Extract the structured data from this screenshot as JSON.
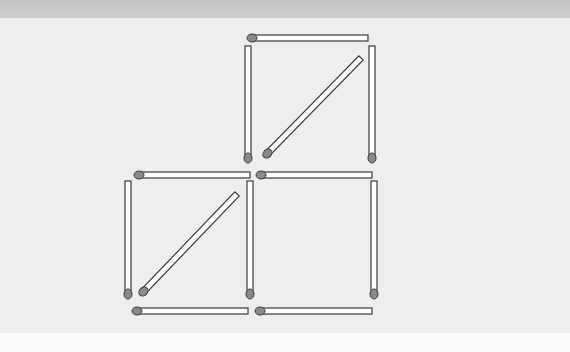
{
  "puzzle": {
    "title": "Matchstick puzzle",
    "match_count": 12,
    "colors": {
      "band": "#c8c8c8",
      "background": "#eeeeee",
      "lower_background": "#fbfbfb",
      "stick_fill": "#ffffff",
      "stick_outline": "#3a3a3a",
      "head_fill": "#8a8a8a"
    },
    "matches": [
      {
        "id": "top-horizontal",
        "x1": 250,
        "y1": 38,
        "x2": 368,
        "y2": 38,
        "head": "start"
      },
      {
        "id": "upper-left-vertical",
        "x1": 248,
        "y1": 160,
        "x2": 248,
        "y2": 46,
        "head": "start"
      },
      {
        "id": "upper-right-vertical",
        "x1": 372,
        "y1": 160,
        "x2": 372,
        "y2": 46,
        "head": "start"
      },
      {
        "id": "upper-diagonal",
        "x1": 266,
        "y1": 155,
        "x2": 361,
        "y2": 58,
        "head": "start"
      },
      {
        "id": "middle-horizontal-left",
        "x1": 137,
        "y1": 175,
        "x2": 250,
        "y2": 175,
        "head": "start"
      },
      {
        "id": "middle-horizontal-right",
        "x1": 259,
        "y1": 175,
        "x2": 372,
        "y2": 175,
        "head": "start"
      },
      {
        "id": "lower-left-vertical",
        "x1": 128,
        "y1": 296,
        "x2": 128,
        "y2": 181,
        "head": "start"
      },
      {
        "id": "middle-vertical",
        "x1": 250,
        "y1": 296,
        "x2": 250,
        "y2": 181,
        "head": "start"
      },
      {
        "id": "lower-right-vertical",
        "x1": 374,
        "y1": 296,
        "x2": 374,
        "y2": 181,
        "head": "start"
      },
      {
        "id": "lower-diagonal",
        "x1": 142,
        "y1": 293,
        "x2": 237,
        "y2": 194,
        "head": "start"
      },
      {
        "id": "bottom-horizontal-left",
        "x1": 135,
        "y1": 311,
        "x2": 248,
        "y2": 311,
        "head": "start"
      },
      {
        "id": "bottom-horizontal-right",
        "x1": 258,
        "y1": 311,
        "x2": 372,
        "y2": 311,
        "head": "start"
      }
    ]
  }
}
